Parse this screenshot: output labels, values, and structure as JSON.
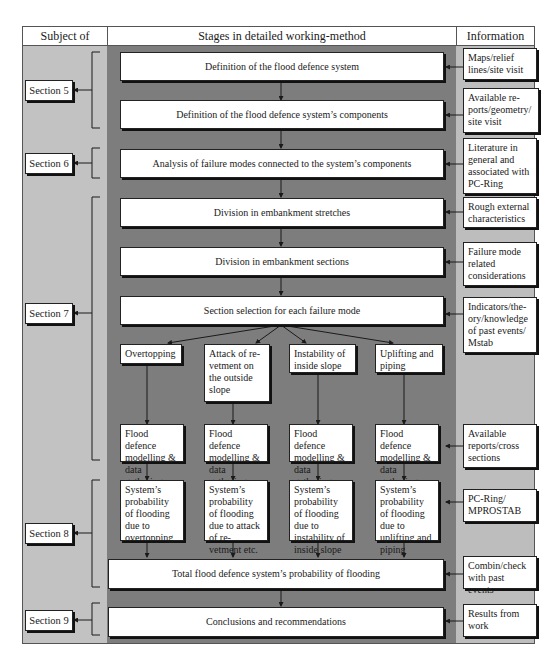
{
  "header": {
    "subject_of": "Subject of",
    "stages": "Stages in detailed working-method",
    "information": "Information"
  },
  "sections": [
    {
      "label": "Section 5"
    },
    {
      "label": "Section 6"
    },
    {
      "label": "Section 7"
    },
    {
      "label": "Section 8"
    },
    {
      "label": "Section 9"
    }
  ],
  "stages": {
    "definition_system": "Definition of the flood defence system",
    "definition_components": "Definition of the flood defence system’s components",
    "analysis_failure_modes": "Analysis of failure modes connected to the system’s components",
    "division_stretches": "Division in embankment stretches",
    "division_sections": "Division in embankment sections",
    "section_selection": "Section selection for each failure mode",
    "failure_modes": [
      "Overtopping",
      "Attack of re-vetment on the outside slope",
      "Instability of inside slope",
      "Uplifting and piping"
    ],
    "modelling": [
      "Flood defence modelling & data gathering",
      "Flood defence modelling & data gathering",
      "Flood defence modelling & data gathering",
      "Flood defence modelling & data gathering"
    ],
    "probabilities": [
      "System’s probability of flooding due to overtopping",
      "System’s probability of flooding due to attack of re-vetment etc.",
      "System’s probability of flooding due to instability of inside slope",
      "System’s probability of flooding due to uplifting and piping"
    ],
    "total_probability": "Total flood defence system’s probability of flooding",
    "conclusions": "Conclusions and recommendations"
  },
  "information": [
    "Maps/relief lines/site visit",
    "Available re-ports/geometry/ site visit",
    "Literature in general and associated with PC-Ring",
    "Rough external characteristics",
    "Failure mode related considerations",
    "Indicators/the-ory/knowledge of past events/ Mstab",
    "Available reports/cross sections",
    "PC-Ring/ MPROSTAB",
    "Combin/check with past events",
    "Results from work"
  ],
  "colors": {
    "left_column": "#c2c2c2",
    "middle_column": "#7d7d7d",
    "right_column": "#bdbdbd",
    "box": "#ffffff",
    "line": "#1a1a1a"
  }
}
